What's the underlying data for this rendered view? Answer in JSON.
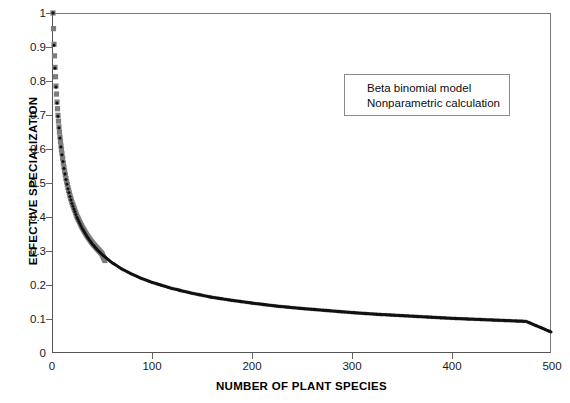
{
  "chart_data": {
    "type": "scatter",
    "title": "",
    "xlabel": "NUMBER OF PLANT SPECIES",
    "ylabel": "EFFECTIVE SPECIALIZATION",
    "xlim": [
      0,
      500
    ],
    "ylim": [
      0,
      1
    ],
    "xticks": [
      0,
      100,
      200,
      300,
      400,
      500
    ],
    "xtick_labels": [
      "0",
      "100",
      "200",
      "300",
      "400",
      "500"
    ],
    "yticks": [
      0,
      0.1,
      0.2,
      0.3,
      0.4,
      0.5,
      0.6,
      0.7,
      0.8,
      0.9,
      1
    ],
    "ytick_labels": [
      "0",
      "0.1",
      "0.2",
      "0.3",
      "0.4",
      "0.5",
      "0.6",
      "0.7",
      "0.8",
      "0.9",
      "1"
    ],
    "grid": false,
    "legend_position": "upper-right-inset",
    "series": [
      {
        "name": "Beta binomial model",
        "marker": "diamond",
        "color": "#111111",
        "x": [
          1,
          2,
          3,
          4,
          5,
          6,
          7,
          8,
          9,
          10,
          12,
          14,
          16,
          18,
          20,
          25,
          30,
          35,
          40,
          45,
          50,
          60,
          70,
          80,
          90,
          100,
          120,
          140,
          160,
          180,
          200,
          225,
          250,
          275,
          300,
          325,
          350,
          375,
          400,
          425,
          450,
          475,
          500
        ],
        "y": [
          1.0,
          0.905,
          0.838,
          0.782,
          0.735,
          0.696,
          0.662,
          0.632,
          0.606,
          0.583,
          0.543,
          0.51,
          0.483,
          0.46,
          0.44,
          0.399,
          0.368,
          0.343,
          0.322,
          0.305,
          0.29,
          0.266,
          0.247,
          0.232,
          0.219,
          0.208,
          0.19,
          0.176,
          0.164,
          0.155,
          0.147,
          0.138,
          0.131,
          0.125,
          0.119,
          0.114,
          0.11,
          0.106,
          0.102,
          0.099,
          0.096,
          0.093,
          0.062
        ]
      },
      {
        "name": "Nonparametric calculation",
        "marker": "square",
        "color": "#7d7d7d",
        "x": [
          1,
          2,
          3,
          4,
          5,
          6,
          7,
          8,
          9,
          10,
          12,
          14,
          16,
          18,
          20,
          25,
          30,
          35,
          40,
          45,
          50,
          53
        ],
        "y": [
          1.0,
          0.908,
          0.84,
          0.785,
          0.738,
          0.699,
          0.665,
          0.635,
          0.609,
          0.586,
          0.546,
          0.513,
          0.486,
          0.463,
          0.443,
          0.402,
          0.371,
          0.346,
          0.325,
          0.308,
          0.292,
          0.272
        ]
      }
    ],
    "legend": [
      {
        "label": "Beta binomial model",
        "marker": "diamond-marker",
        "color": "#111111"
      },
      {
        "label": "Nonparametric calculation",
        "marker": "square-marker",
        "color": "#7d7d7d"
      }
    ]
  }
}
